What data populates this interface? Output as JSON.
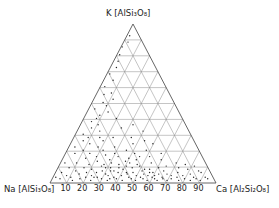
{
  "diagram": {
    "type": "ternary",
    "vertices": {
      "top": {
        "label": "K [AlSi3O8]",
        "element": "K",
        "formula": "[AlSi₃O₈]"
      },
      "left": {
        "label": "Na [AlSi3O8]",
        "element": "Na",
        "formula": "[AlSi₃O₈]"
      },
      "right": {
        "label": "Ca [Al2Si2O8]",
        "element": "Ca",
        "formula": "[Al₂Si₂O₈]"
      }
    },
    "bottom_ticks": [
      "10",
      "20",
      "30",
      "40",
      "50",
      "60",
      "70",
      "80",
      "90"
    ],
    "grid_step_percent": 10,
    "colors": {
      "line": "#555555",
      "grid": "#8a8a8a",
      "point": "#222222"
    }
  },
  "chart_data": {
    "type": "scatter",
    "subtype": "ternary",
    "title": "",
    "axes": [
      "Na[AlSi3O8]",
      "K[AlSi3O8]",
      "Ca[Al2Si2O8]"
    ],
    "bottom_axis_ticks": [
      10,
      20,
      30,
      40,
      50,
      60,
      70,
      80,
      90
    ],
    "grid": true,
    "points_ca_k": [
      [
        2,
        3
      ],
      [
        4,
        6
      ],
      [
        5,
        2
      ],
      [
        7,
        9
      ],
      [
        8,
        4
      ],
      [
        10,
        12
      ],
      [
        11,
        3
      ],
      [
        12,
        7
      ],
      [
        13,
        1
      ],
      [
        14,
        15
      ],
      [
        15,
        5
      ],
      [
        16,
        9
      ],
      [
        17,
        2
      ],
      [
        18,
        11
      ],
      [
        19,
        6
      ],
      [
        20,
        3
      ],
      [
        21,
        8
      ],
      [
        22,
        13
      ],
      [
        23,
        4
      ],
      [
        24,
        1
      ],
      [
        25,
        6
      ],
      [
        26,
        10
      ],
      [
        27,
        3
      ],
      [
        28,
        7
      ],
      [
        29,
        14
      ],
      [
        30,
        2
      ],
      [
        31,
        5
      ],
      [
        32,
        9
      ],
      [
        33,
        4
      ],
      [
        34,
        1
      ],
      [
        35,
        7
      ],
      [
        36,
        11
      ],
      [
        37,
        3
      ],
      [
        38,
        6
      ],
      [
        39,
        2
      ],
      [
        40,
        8
      ],
      [
        41,
        4
      ],
      [
        42,
        12
      ],
      [
        43,
        1
      ],
      [
        44,
        5
      ],
      [
        45,
        9
      ],
      [
        46,
        3
      ],
      [
        47,
        6
      ],
      [
        48,
        2
      ],
      [
        49,
        10
      ],
      [
        50,
        4
      ],
      [
        51,
        1
      ],
      [
        52,
        7
      ],
      [
        53,
        3
      ],
      [
        54,
        5
      ],
      [
        55,
        2
      ],
      [
        56,
        8
      ],
      [
        57,
        4
      ],
      [
        58,
        1
      ],
      [
        59,
        6
      ],
      [
        60,
        3
      ],
      [
        61,
        9
      ],
      [
        62,
        2
      ],
      [
        63,
        5
      ],
      [
        64,
        1
      ],
      [
        65,
        7
      ],
      [
        66,
        3
      ],
      [
        67,
        2
      ],
      [
        68,
        5
      ],
      [
        70,
        1
      ],
      [
        71,
        4
      ],
      [
        72,
        2
      ],
      [
        74,
        6
      ],
      [
        75,
        3
      ],
      [
        77,
        1
      ],
      [
        78,
        4
      ],
      [
        80,
        2
      ],
      [
        82,
        5
      ],
      [
        84,
        1
      ],
      [
        85,
        3
      ],
      [
        87,
        2
      ],
      [
        88,
        6
      ],
      [
        90,
        1
      ],
      [
        92,
        3
      ],
      [
        94,
        2
      ],
      [
        3,
        12
      ],
      [
        6,
        18
      ],
      [
        4,
        22
      ],
      [
        7,
        26
      ],
      [
        5,
        30
      ],
      [
        8,
        34
      ],
      [
        6,
        38
      ],
      [
        9,
        42
      ],
      [
        4,
        46
      ],
      [
        7,
        50
      ],
      [
        5,
        55
      ],
      [
        3,
        60
      ],
      [
        6,
        64
      ],
      [
        2,
        68
      ],
      [
        4,
        72
      ],
      [
        3,
        76
      ],
      [
        2,
        80
      ],
      [
        1,
        85
      ],
      [
        3,
        88
      ],
      [
        2,
        92
      ],
      [
        10,
        20
      ],
      [
        12,
        24
      ],
      [
        9,
        28
      ],
      [
        14,
        32
      ],
      [
        11,
        36
      ],
      [
        8,
        40
      ],
      [
        13,
        44
      ],
      [
        10,
        48
      ],
      [
        12,
        52
      ],
      [
        9,
        56
      ],
      [
        15,
        18
      ],
      [
        18,
        22
      ],
      [
        20,
        16
      ],
      [
        16,
        28
      ],
      [
        22,
        20
      ],
      [
        25,
        17
      ],
      [
        19,
        26
      ],
      [
        28,
        22
      ],
      [
        30,
        18
      ],
      [
        24,
        28
      ],
      [
        33,
        16
      ],
      [
        36,
        20
      ],
      [
        40,
        15
      ],
      [
        38,
        24
      ],
      [
        42,
        18
      ],
      [
        45,
        14
      ],
      [
        48,
        20
      ],
      [
        52,
        16
      ],
      [
        55,
        12
      ],
      [
        58,
        18
      ],
      [
        35,
        28
      ],
      [
        44,
        26
      ],
      [
        50,
        24
      ],
      [
        26,
        34
      ],
      [
        32,
        36
      ],
      [
        20,
        40
      ],
      [
        40,
        32
      ],
      [
        60,
        14
      ],
      [
        65,
        10
      ],
      [
        70,
        12
      ],
      [
        73,
        9
      ],
      [
        76,
        11
      ],
      [
        79,
        8
      ],
      [
        82,
        10
      ],
      [
        86,
        7
      ],
      [
        25,
        3
      ],
      [
        33,
        7
      ],
      [
        27,
        11
      ],
      [
        35,
        2
      ],
      [
        41,
        10
      ],
      [
        43,
        6
      ],
      [
        47,
        11
      ],
      [
        53,
        8
      ],
      [
        57,
        6
      ],
      [
        61,
        4
      ],
      [
        37,
        9
      ],
      [
        29,
        9
      ],
      [
        31,
        12
      ],
      [
        39,
        13
      ],
      [
        46,
        16
      ]
    ]
  }
}
